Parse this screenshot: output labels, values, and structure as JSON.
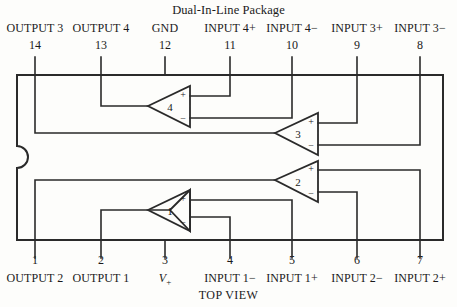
{
  "figure": {
    "title": "Dual-In-Line Package",
    "view_label": "TOP VIEW",
    "package_type": "14-pin DIP",
    "line_color": "#2a2a2a",
    "background_color": "#fdfdfb"
  },
  "top_pins": [
    {
      "number": "14",
      "label": "OUTPUT 3",
      "x": 35
    },
    {
      "number": "13",
      "label": "OUTPUT 4",
      "x": 101
    },
    {
      "number": "12",
      "label": "GND",
      "x": 165
    },
    {
      "number": "11",
      "label": "INPUT 4+",
      "x": 230
    },
    {
      "number": "10",
      "label": "INPUT 4−",
      "x": 292
    },
    {
      "number": "9",
      "label": "INPUT 3+",
      "x": 357
    },
    {
      "number": "8",
      "label": "INPUT 3−",
      "x": 420
    }
  ],
  "bottom_pins": [
    {
      "number": "1",
      "label": "OUTPUT 2",
      "x": 35
    },
    {
      "number": "2",
      "label": "OUTPUT 1",
      "x": 101
    },
    {
      "number": "3",
      "label": "V+",
      "x": 165,
      "italic_v": true
    },
    {
      "number": "4",
      "label": "INPUT 1−",
      "x": 230
    },
    {
      "number": "5",
      "label": "INPUT 1+",
      "x": 292
    },
    {
      "number": "6",
      "label": "INPUT 2−",
      "x": 357
    },
    {
      "number": "7",
      "label": "INPUT 2+",
      "x": 420
    }
  ],
  "amplifiers": [
    {
      "id": "1",
      "number": "1",
      "plus_sign": "+",
      "minus_sign": "−"
    },
    {
      "id": "2",
      "number": "2",
      "plus_sign": "+",
      "minus_sign": "−"
    },
    {
      "id": "3",
      "number": "3",
      "plus_sign": "+",
      "minus_sign": "−"
    },
    {
      "id": "4",
      "number": "4",
      "plus_sign": "+",
      "minus_sign": "−"
    }
  ]
}
